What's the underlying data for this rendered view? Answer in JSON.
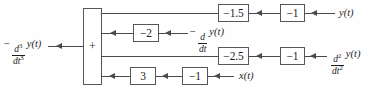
{
  "diagram": {
    "type": "signal-flow block diagram",
    "background_color": "#ffffff",
    "line_color": "#4a4a4a",
    "box_border_color": "#55555d",
    "text_color": "#1c1c1c",
    "summing_junction": {
      "name": "summer",
      "sign": "+"
    },
    "output": {
      "label_parts": {
        "sign": "−",
        "numerator": "d",
        "numerator_exp": "3",
        "denominator": "dt",
        "denominator_exp": "3",
        "function": "y",
        "arg": "(t)"
      },
      "label_text": "− d³/dt³ y(t)"
    },
    "rows": [
      {
        "id": "row-1",
        "input_label": "y(t)",
        "input_parts": {
          "function": "y",
          "arg": "(t)"
        },
        "gains": [
          "−1",
          "−1.5"
        ],
        "description": "y(t) through gain -1 then gain -1.5 into summer"
      },
      {
        "id": "row-2",
        "input_label": "− d/dt y(t)",
        "input_parts": {
          "sign": "−",
          "numerator": "d",
          "denominator": "dt",
          "function": "y",
          "arg": "(t)"
        },
        "gains": [
          "−2"
        ],
        "description": "negative first derivative of y through gain -2 into summer"
      },
      {
        "id": "row-3",
        "input_label": "d²/dt² y(t)",
        "input_parts": {
          "numerator": "d",
          "numerator_exp": "2",
          "denominator": "dt",
          "denominator_exp": "2",
          "function": "y",
          "arg": "(t)"
        },
        "gains": [
          "−1",
          "−2.5"
        ],
        "description": "second derivative of y through gain -1 then -2.5 into summer"
      },
      {
        "id": "row-4",
        "input_label": "x(t)",
        "input_parts": {
          "function": "x",
          "arg": "(t)"
        },
        "gains": [
          "−1",
          "3"
        ],
        "description": "input x(t) through gain -1 then gain 3 into summer"
      }
    ]
  },
  "gain_values": {
    "r1_inner": "−1.5",
    "r1_outer": "−1",
    "r2_inner": "−2",
    "r3_inner": "−2.5",
    "r3_outer": "−1",
    "r4_inner": "3",
    "r4_outer": "−1"
  }
}
